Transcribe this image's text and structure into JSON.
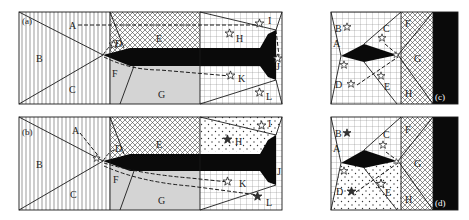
{
  "figure": {
    "panels": [
      {
        "id": "a",
        "label": "(a)",
        "regions": [
          "A",
          "B",
          "C",
          "D",
          "E",
          "F",
          "G",
          "H",
          "I",
          "J",
          "K",
          "L"
        ],
        "open_star_regions": [
          "D",
          "H",
          "I",
          "J",
          "K",
          "L"
        ],
        "filled_star_regions": [],
        "dashed_paths_from": [
          "A",
          "D",
          "F"
        ]
      },
      {
        "id": "b",
        "label": "(b)",
        "regions": [
          "A",
          "B",
          "C",
          "D",
          "E",
          "F",
          "G",
          "H",
          "I",
          "J",
          "K",
          "L"
        ],
        "open_star_regions": [
          "D",
          "I",
          "K"
        ],
        "filled_star_regions": [
          "H",
          "L"
        ],
        "dashed_paths_from": [
          "A",
          "D",
          "F"
        ]
      },
      {
        "id": "c",
        "label": "(c)",
        "regions": [
          "A",
          "B",
          "C",
          "D",
          "E",
          "F",
          "G",
          "H"
        ],
        "open_star_regions": [
          "A",
          "B",
          "C",
          "D",
          "E"
        ],
        "filled_star_regions": [],
        "dashed_paths_from": [
          "C",
          "D"
        ]
      },
      {
        "id": "d",
        "label": "(d)",
        "regions": [
          "A",
          "B",
          "C",
          "D",
          "E",
          "F",
          "G",
          "H"
        ],
        "open_star_regions": [
          "A",
          "C",
          "E"
        ],
        "filled_star_regions": [
          "B",
          "D"
        ],
        "dashed_paths_from": [
          "C",
          "D"
        ]
      }
    ],
    "labels": {
      "a": "(a)",
      "b": "(b)",
      "c": "(c)",
      "d": "(d)",
      "A": "A",
      "B": "B",
      "C": "C",
      "D": "D",
      "E": "E",
      "F": "F",
      "G": "G",
      "H": "H",
      "I": "I",
      "J": "J",
      "K": "K",
      "L": "L"
    },
    "colors": {
      "ink": "#1a1a1a",
      "gray_fill": "#d4d4d4",
      "black_fill": "#0a0a0a",
      "background": "#ffffff"
    }
  }
}
